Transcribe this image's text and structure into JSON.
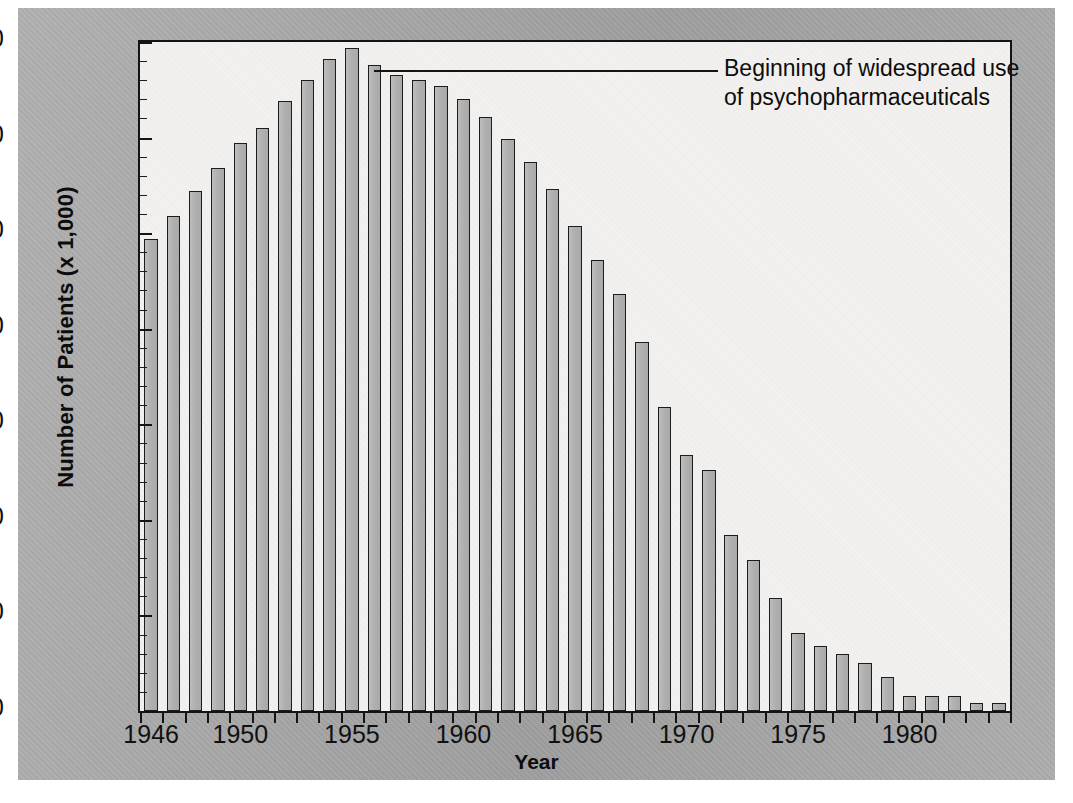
{
  "chart_data": {
    "type": "bar",
    "title": "",
    "xlabel": "Year",
    "ylabel": "Number of Patients (x 1,000)",
    "ylim": [
      200,
      550
    ],
    "ytick_step": 50,
    "yminor_step": 10,
    "grid": false,
    "legend": null,
    "categories": [
      "1946",
      "1947",
      "1948",
      "1949",
      "1950",
      "1951",
      "1952",
      "1953",
      "1954",
      "1955",
      "1956",
      "1957",
      "1958",
      "1959",
      "1960",
      "1961",
      "1962",
      "1963",
      "1964",
      "1965",
      "1966",
      "1967",
      "1968",
      "1969",
      "1970",
      "1971",
      "1972",
      "1973",
      "1974",
      "1975",
      "1976",
      "1977",
      "1978",
      "1979",
      "1980",
      "1981",
      "1982",
      "1983",
      "1984"
    ],
    "values": [
      447,
      459,
      472,
      484,
      497,
      505,
      519,
      530,
      541,
      547,
      538,
      533,
      530,
      527,
      520,
      511,
      499,
      487,
      473,
      454,
      436,
      418,
      393,
      359,
      334,
      326,
      292,
      279,
      259,
      241,
      234,
      230,
      225,
      218,
      208,
      208,
      208,
      204,
      204
    ],
    "ytick_labels": [
      "550",
      "500",
      "450",
      "400",
      "350",
      "300",
      "250",
      "200"
    ],
    "xtick_labels": [
      "1946",
      "1950",
      "1955",
      "1960",
      "1965",
      "1970",
      "1975",
      "1980"
    ],
    "xtick_years": [
      1946,
      1950,
      1955,
      1960,
      1965,
      1970,
      1975,
      1980
    ],
    "annotation": {
      "text": "Beginning of widespread use\nof psychopharmaceuticals",
      "points_to_year": 1956
    },
    "colors": {
      "bar_fill": "#b4b4b4",
      "bar_edge": "#1c1c1c",
      "plot_background": "#f2f1ef",
      "figure_background": "#a8a8a8",
      "text": "#101010"
    }
  }
}
